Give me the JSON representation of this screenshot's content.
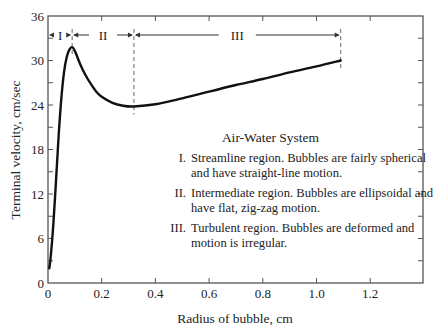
{
  "chart_data": {
    "type": "line",
    "title": "Air-Water System",
    "xlabel": "Radius of bubble, cm",
    "ylabel": "Terminal velocity, cm/sec",
    "xlim": [
      0,
      1.4
    ],
    "ylim": [
      0,
      36
    ],
    "x_ticks": [
      "0",
      "0.2",
      "0.4",
      "0.6",
      "0.8",
      "1.0",
      "1.2"
    ],
    "y_ticks": [
      "0",
      "6",
      "12",
      "18",
      "24",
      "30",
      "36"
    ],
    "grid": false,
    "series": [
      {
        "name": "Terminal velocity",
        "x": [
          0.005,
          0.01,
          0.02,
          0.03,
          0.04,
          0.05,
          0.06,
          0.07,
          0.08,
          0.09,
          0.1,
          0.12,
          0.14,
          0.16,
          0.18,
          0.2,
          0.24,
          0.28,
          0.32,
          0.4,
          0.5,
          0.6,
          0.7,
          0.8,
          0.9,
          1.0,
          1.09
        ],
        "values": [
          2.0,
          3.5,
          8.0,
          14.0,
          20.0,
          25.0,
          28.5,
          30.5,
          31.5,
          31.8,
          31.3,
          29.5,
          28.0,
          26.8,
          25.8,
          25.1,
          24.3,
          23.9,
          23.8,
          24.1,
          24.9,
          25.8,
          26.7,
          27.5,
          28.4,
          29.2,
          30.0
        ]
      }
    ],
    "regions": [
      {
        "label": "I",
        "x_start": 0.0,
        "x_end": 0.09
      },
      {
        "label": "II",
        "x_start": 0.09,
        "x_end": 0.32
      },
      {
        "label": "III",
        "x_start": 0.32,
        "x_end": 1.09
      }
    ],
    "legend": {
      "title": "Air-Water System",
      "items": [
        {
          "num": "I.",
          "text": "Streamline region. Bubbles are fairly spherical and have straight-line motion."
        },
        {
          "num": "II.",
          "text": "Intermediate region. Bubbles are ellipsoidal and have flat, zig-zag motion."
        },
        {
          "num": "III.",
          "text": "Turbulent region. Bubbles are deformed and motion is irregular."
        }
      ]
    }
  },
  "colors": {
    "line": "#111111",
    "axis": "#555555",
    "dashed": "#777777"
  }
}
